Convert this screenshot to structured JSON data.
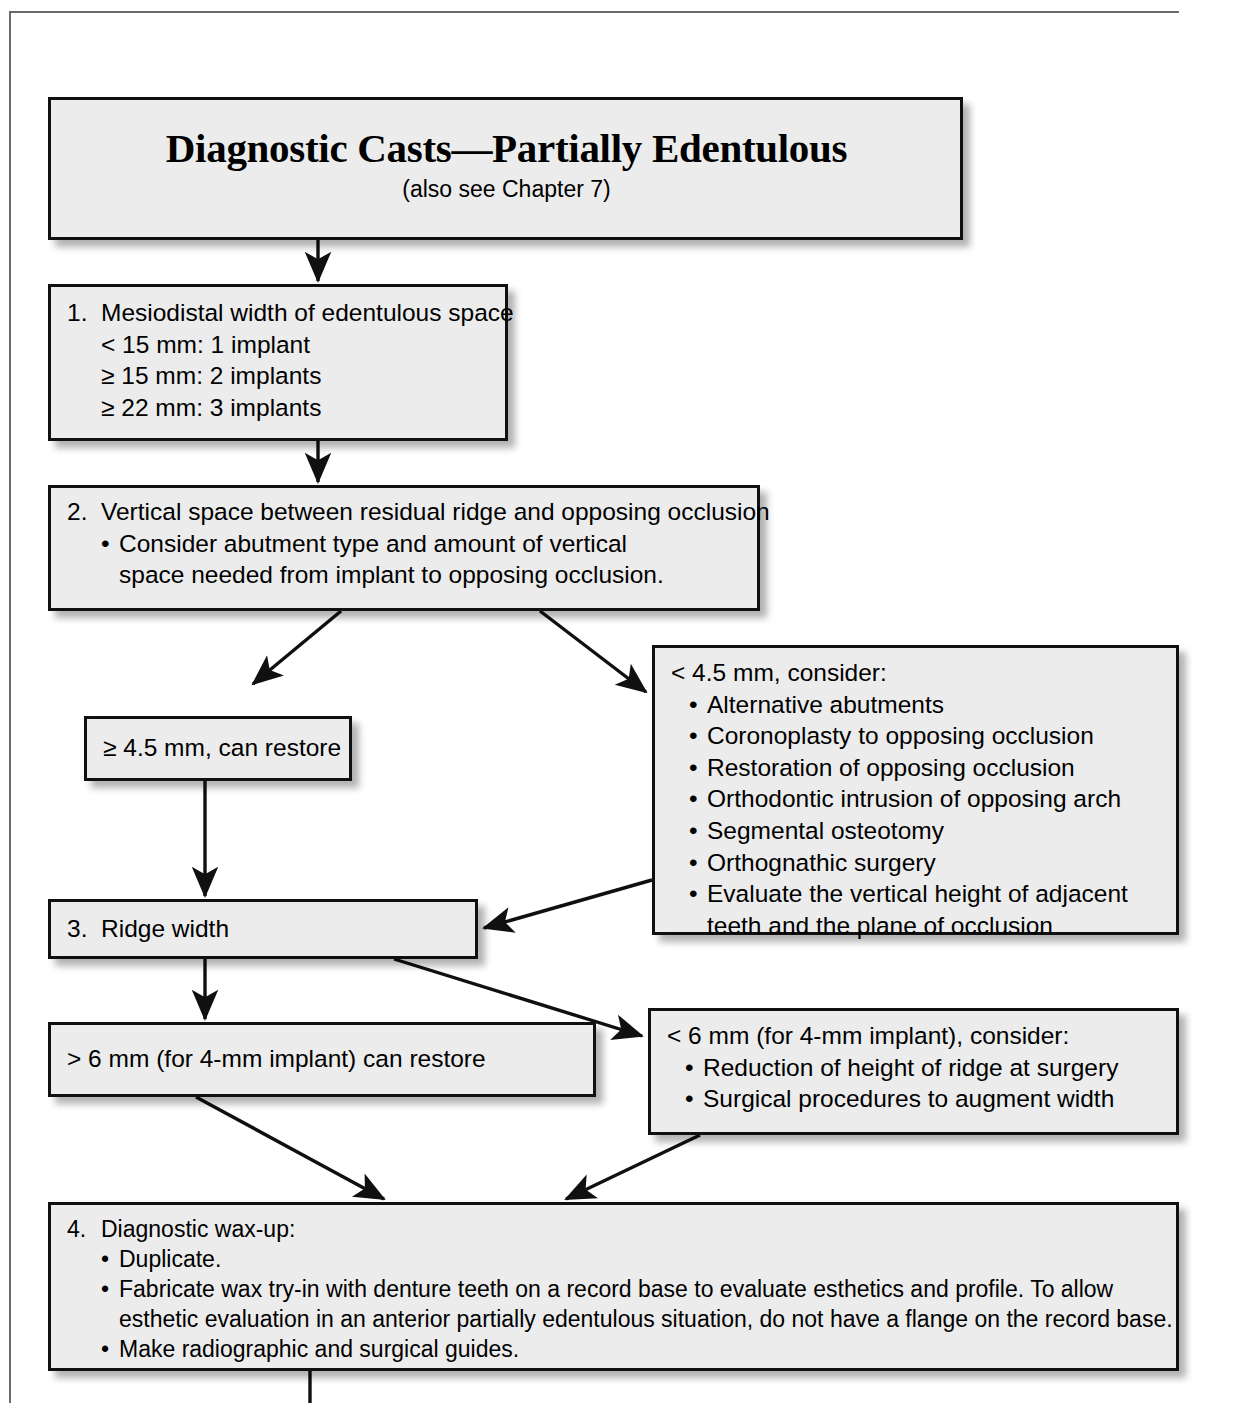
{
  "page": {
    "title": "Diagnostic Casts—Partially Edentulous",
    "subtitle": "(also see Chapter 7)"
  },
  "flowchart": {
    "type": "flowchart",
    "orientation": "top-to-bottom",
    "nodes": [
      {
        "id": "title",
        "name": "title-box",
        "heading": "Diagnostic Casts—Partially Edentulous",
        "subheading": "(also see Chapter 7)"
      },
      {
        "id": "step1",
        "name": "step-1-box",
        "number": "1.",
        "heading": "Mesiodistal width of edentulous space",
        "lines": [
          "< 15 mm: 1 implant",
          "≥ 15 mm: 2 implants",
          "≥ 22 mm: 3 implants"
        ]
      },
      {
        "id": "step2",
        "name": "step-2-box",
        "number": "2.",
        "heading": "Vertical space between residual ridge and opposing occlusion",
        "bullets": [
          "Consider abutment type and amount of vertical space needed from implant to opposing occlusion."
        ]
      },
      {
        "id": "vert-ok",
        "name": "vertical-space-ok-box",
        "heading": "≥ 4.5 mm, can restore"
      },
      {
        "id": "vert-low",
        "name": "vertical-space-insufficient-box",
        "heading": "< 4.5 mm, consider:",
        "bullets": [
          "Alternative abutments",
          "Coronoplasty to opposing occlusion",
          "Restoration of opposing occlusion",
          "Orthodontic intrusion of opposing arch",
          "Segmental osteotomy",
          "Orthognathic surgery",
          "Evaluate the vertical height of adjacent teeth and the plane of occlusion"
        ]
      },
      {
        "id": "step3",
        "name": "step-3-box",
        "number": "3.",
        "heading": "Ridge width"
      },
      {
        "id": "width-ok",
        "name": "ridge-width-ok-box",
        "heading": "> 6 mm (for 4-mm implant) can restore"
      },
      {
        "id": "width-low",
        "name": "ridge-width-insufficient-box",
        "heading": "< 6 mm (for 4-mm implant), consider:",
        "bullets": [
          "Reduction of height of ridge at surgery",
          "Surgical procedures to augment width"
        ]
      },
      {
        "id": "step4",
        "name": "step-4-box",
        "number": "4.",
        "heading": "Diagnostic wax-up:",
        "bullets": [
          "Duplicate.",
          "Fabricate wax try-in with denture teeth on a record base to evaluate esthetics and profile. To allow esthetic evaluation in an anterior partially edentulous situation, do not have a flange on the record base.",
          "Make radiographic and surgical guides."
        ]
      }
    ],
    "edges": [
      {
        "from": "title",
        "to": "step1",
        "style": "arrow-down"
      },
      {
        "from": "step1",
        "to": "step2",
        "style": "arrow-down"
      },
      {
        "from": "step2",
        "to": "vert-ok",
        "style": "arrow-diagonal-left"
      },
      {
        "from": "step2",
        "to": "vert-low",
        "style": "arrow-diagonal-right"
      },
      {
        "from": "vert-ok",
        "to": "step3",
        "style": "arrow-down"
      },
      {
        "from": "vert-low",
        "to": "step3",
        "style": "arrow-diagonal-left"
      },
      {
        "from": "step3",
        "to": "width-ok",
        "style": "arrow-down"
      },
      {
        "from": "step3",
        "to": "width-low",
        "style": "arrow-diagonal-right"
      },
      {
        "from": "width-ok",
        "to": "step4",
        "style": "arrow-diagonal-right"
      },
      {
        "from": "width-low",
        "to": "step4",
        "style": "arrow-diagonal-left"
      },
      {
        "from": "step4",
        "to": "next",
        "style": "line-down"
      }
    ]
  },
  "colors": {
    "box_fill": "#ececec",
    "box_border": "#101010",
    "page_rule": "#6a6a6a",
    "text": "#000000"
  }
}
